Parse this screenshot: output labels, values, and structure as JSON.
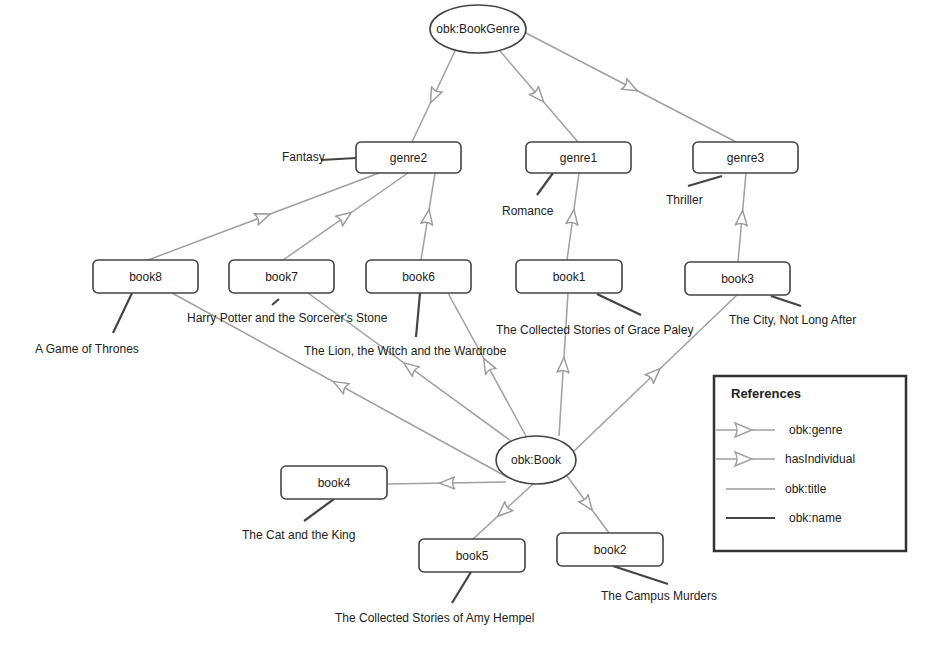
{
  "colors": {
    "background": "#ffffff",
    "node_stroke": "#444444",
    "ref_edge": "#a0a0a0",
    "title_edge": "#9a9a9a",
    "name_edge": "#444444",
    "text": "#222222"
  },
  "classes": [
    {
      "id": "BookGenre",
      "label": "obk:BookGenre",
      "cx": 478,
      "cy": 29,
      "rx": 48,
      "ry": 24
    },
    {
      "id": "Book",
      "label": "obk:Book",
      "cx": 536,
      "cy": 460,
      "rx": 40,
      "ry": 24
    }
  ],
  "individuals": [
    {
      "id": "genre2",
      "label": "genre2",
      "x": 356,
      "y": 142,
      "w": 105,
      "h": 31
    },
    {
      "id": "genre1",
      "label": "genre1",
      "x": 526,
      "y": 142,
      "w": 105,
      "h": 31
    },
    {
      "id": "genre3",
      "label": "genre3",
      "x": 693,
      "y": 142,
      "w": 105,
      "h": 31
    },
    {
      "id": "book8",
      "label": "book8",
      "x": 93,
      "y": 260,
      "w": 105,
      "h": 33
    },
    {
      "id": "book7",
      "label": "book7",
      "x": 229,
      "y": 260,
      "w": 105,
      "h": 33
    },
    {
      "id": "book6",
      "label": "book6",
      "x": 366,
      "y": 260,
      "w": 105,
      "h": 33
    },
    {
      "id": "book1",
      "label": "book1",
      "x": 516,
      "y": 260,
      "w": 106,
      "h": 33
    },
    {
      "id": "book3",
      "label": "book3",
      "x": 685,
      "y": 262,
      "w": 105,
      "h": 33
    },
    {
      "id": "book4",
      "label": "book4",
      "x": 281,
      "y": 466,
      "w": 106,
      "h": 33
    },
    {
      "id": "book5",
      "label": "book5",
      "x": 419,
      "y": 539,
      "w": 106,
      "h": 33
    },
    {
      "id": "book2",
      "label": "book2",
      "x": 557,
      "y": 533,
      "w": 106,
      "h": 33
    }
  ],
  "literals": [
    {
      "text": "Fantasy",
      "x": 282,
      "y": 161,
      "anchor": "start"
    },
    {
      "text": "Romance",
      "x": 502,
      "y": 215,
      "anchor": "start"
    },
    {
      "text": "Thriller",
      "x": 666,
      "y": 204,
      "anchor": "start"
    },
    {
      "text": "A Game of Thrones",
      "x": 35,
      "y": 353,
      "anchor": "start"
    },
    {
      "text": "Harry Potter and the Sorcerer's Stone",
      "x": 187,
      "y": 322,
      "anchor": "start"
    },
    {
      "text": "The Lion, the Witch and the Wardrobe",
      "x": 304,
      "y": 355,
      "anchor": "start"
    },
    {
      "text": "The Collected Stories of Grace Paley",
      "x": 496,
      "y": 334,
      "anchor": "start"
    },
    {
      "text": "The City, Not Long After",
      "x": 729,
      "y": 324,
      "anchor": "start"
    },
    {
      "text": "The Cat and the King",
      "x": 242,
      "y": 539,
      "anchor": "start"
    },
    {
      "text": "The Collected Stories of Amy Hempel",
      "x": 335,
      "y": 622,
      "anchor": "start"
    },
    {
      "text": "The Campus Murders",
      "x": 601,
      "y": 600,
      "anchor": "start"
    }
  ],
  "edges": {
    "obk_genre": [
      {
        "from": "BookGenre",
        "to": "genre2",
        "x1": 455,
        "y1": 51,
        "x2": 412,
        "y2": 142
      },
      {
        "from": "BookGenre",
        "to": "genre1",
        "x1": 500,
        "y1": 51,
        "x2": 578,
        "y2": 142
      },
      {
        "from": "BookGenre",
        "to": "genre3",
        "x1": 526,
        "y1": 33,
        "x2": 736,
        "y2": 142
      },
      {
        "from": "book8",
        "to": "genre2",
        "x1": 148,
        "y1": 260,
        "x2": 379,
        "y2": 173
      },
      {
        "from": "book7",
        "to": "genre2",
        "x1": 283,
        "y1": 260,
        "x2": 408,
        "y2": 173
      },
      {
        "from": "book6",
        "to": "genre2",
        "x1": 421,
        "y1": 260,
        "x2": 435,
        "y2": 173
      },
      {
        "from": "book1",
        "to": "genre1",
        "x1": 567,
        "y1": 260,
        "x2": 579,
        "y2": 173
      },
      {
        "from": "book3",
        "to": "genre3",
        "x1": 738,
        "y1": 262,
        "x2": 746,
        "y2": 173
      }
    ],
    "hasIndividual": [
      {
        "from": "Book",
        "to": "book8",
        "x1": 507,
        "y1": 477,
        "x2": 172,
        "y2": 293
      },
      {
        "from": "Book",
        "to": "book7",
        "x1": 511,
        "y1": 441,
        "x2": 308,
        "y2": 293
      },
      {
        "from": "Book",
        "to": "book6",
        "x1": 526,
        "y1": 436,
        "x2": 448,
        "y2": 293
      },
      {
        "from": "Book",
        "to": "book1",
        "x1": 559,
        "y1": 436,
        "x2": 568,
        "y2": 293
      },
      {
        "from": "Book",
        "to": "book3",
        "x1": 573,
        "y1": 452,
        "x2": 737,
        "y2": 295
      },
      {
        "from": "Book",
        "to": "book4",
        "x1": 506,
        "y1": 482,
        "x2": 387,
        "y2": 484
      },
      {
        "from": "Book",
        "to": "book5",
        "x1": 533,
        "y1": 484,
        "x2": 473,
        "y2": 539
      },
      {
        "from": "Book",
        "to": "book2",
        "x1": 567,
        "y1": 476,
        "x2": 609,
        "y2": 533
      }
    ],
    "obk_title": [
      {
        "from": "genre1",
        "x1": 553,
        "y1": 173,
        "x2": 537,
        "y2": 195
      },
      {
        "from": "genre3",
        "x1": 722,
        "y1": 176,
        "x2": 688,
        "y2": 186
      }
    ],
    "obk_name": [
      {
        "from": "genre2",
        "x1": 356,
        "y1": 158,
        "x2": 321,
        "y2": 160
      },
      {
        "from": "book8",
        "x1": 132,
        "y1": 293,
        "x2": 113,
        "y2": 333
      },
      {
        "from": "book7",
        "x1": 279,
        "y1": 299,
        "x2": 272,
        "y2": 305
      },
      {
        "from": "book6",
        "x1": 420,
        "y1": 293,
        "x2": 416,
        "y2": 337
      },
      {
        "from": "book1",
        "x1": 597,
        "y1": 294,
        "x2": 641,
        "y2": 315
      },
      {
        "from": "book3",
        "x1": 771,
        "y1": 296,
        "x2": 801,
        "y2": 306
      },
      {
        "from": "book4",
        "x1": 334,
        "y1": 499,
        "x2": 304,
        "y2": 521
      },
      {
        "from": "book5",
        "x1": 471,
        "y1": 572,
        "x2": 452,
        "y2": 603
      },
      {
        "from": "book2",
        "x1": 613,
        "y1": 566,
        "x2": 668,
        "y2": 584
      }
    ]
  },
  "legend": {
    "title": "References",
    "x": 714,
    "y": 376,
    "w": 192,
    "h": 175,
    "items": [
      {
        "label": "obk:genre",
        "kind": "arrow"
      },
      {
        "label": "hasIndividual",
        "kind": "arrow"
      },
      {
        "label": "obk:title",
        "kind": "line-light"
      },
      {
        "label": "obk:name",
        "kind": "line-dark"
      }
    ]
  }
}
